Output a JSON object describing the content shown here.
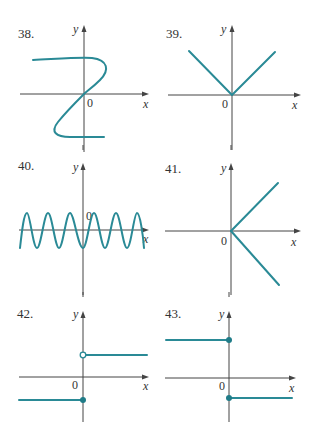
{
  "colors": {
    "curve": "#2a8a96",
    "axis": "#444444",
    "text": "#333333",
    "background": "#ffffff"
  },
  "graphs": [
    {
      "number": "38.",
      "x_label": "x",
      "y_label": "y",
      "origin_label": "0",
      "description": "S-shaped curve through origin (not a function of x)"
    },
    {
      "number": "39.",
      "x_label": "x",
      "y_label": "y",
      "origin_label": "0",
      "description": "V shape, absolute value with vertex at origin"
    },
    {
      "number": "40.",
      "x_label": "x",
      "y_label": "y",
      "origin_label": "0",
      "description": "Oscillating sinusoidal wave across x-axis"
    },
    {
      "number": "41.",
      "x_label": "x",
      "y_label": "y",
      "origin_label": "0",
      "description": "Two rays from origin, one up-right and one down-right"
    },
    {
      "number": "42.",
      "x_label": "x",
      "y_label": "y",
      "origin_label": "0",
      "description": "Step function: open circle at top on y-axis, closed dot at bottom"
    },
    {
      "number": "43.",
      "x_label": "x",
      "y_label": "y",
      "origin_label": "0",
      "description": "Step function: closed dots at both top and bottom on y-axis"
    }
  ]
}
